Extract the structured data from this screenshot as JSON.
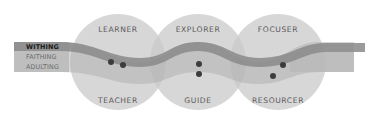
{
  "diagram": {
    "circles": [
      {
        "top_label": "LEARNER",
        "bottom_label": "TEACHER"
      },
      {
        "top_label": "EXPLORER",
        "bottom_label": "GUIDE"
      },
      {
        "top_label": "FOCUSER",
        "bottom_label": "RESOURCER"
      }
    ],
    "bands": [
      {
        "label": "WITHING",
        "active": true
      },
      {
        "label": "FAITHING",
        "active": false
      },
      {
        "label": "ADULTING",
        "active": false
      }
    ],
    "colors": {
      "circle_fill": "#d4d4d4",
      "circle_overlap": "#b8b8b8",
      "dark_band": "#8f8f8f",
      "light_band": "#b5b5b5",
      "dot": "#3c3c3c",
      "label_text": "#5a5a5a"
    }
  }
}
